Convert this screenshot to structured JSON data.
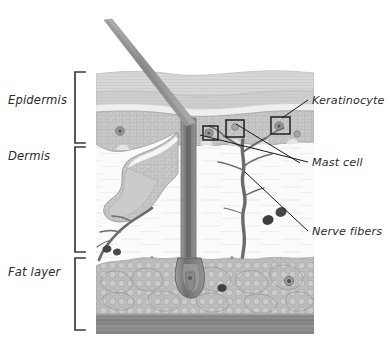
{
  "figure": {
    "type": "anatomical-cross-section",
    "orientation": "vertical-layers"
  },
  "layer_labels": [
    {
      "id": "epidermis",
      "text": "Epidermis",
      "side": "left",
      "text_x": 8,
      "text_y": 104,
      "bracket_x": 74,
      "bracket_top": 72,
      "bracket_bottom": 143
    },
    {
      "id": "dermis",
      "text": "Dermis",
      "side": "left",
      "text_x": 8,
      "text_y": 160,
      "bracket_x": 74,
      "bracket_top": 147,
      "bracket_bottom": 252
    },
    {
      "id": "fat-layer",
      "text": "Fat layer",
      "side": "left",
      "text_x": 8,
      "text_y": 276,
      "bracket_x": 74,
      "bracket_top": 258,
      "bracket_bottom": 330
    }
  ],
  "callouts": [
    {
      "id": "keratinocyte",
      "text": "Keratinocyte",
      "text_x": 312,
      "text_y": 104,
      "leader": [
        [
          308,
          100
        ],
        [
          275,
          124
        ]
      ],
      "marker_boxes": [
        [
          271,
          117,
          19,
          17
        ],
        [
          226,
          120,
          18,
          17
        ],
        [
          203,
          126,
          15,
          14
        ]
      ]
    },
    {
      "id": "mast-cell",
      "text": "Mast cell",
      "text_x": 312,
      "text_y": 166,
      "leader": [
        [
          308,
          162
        ],
        [
          200,
          135
        ]
      ],
      "extra_leaders": [
        [
          [
            296,
            163
          ],
          [
            234,
            123
          ]
        ]
      ]
    },
    {
      "id": "nerve-fibers",
      "text": "Nerve fibers",
      "text_x": 312,
      "text_y": 235,
      "leader": [
        [
          308,
          231
        ],
        [
          243,
          175
        ]
      ]
    }
  ],
  "colors": {
    "background": "#ffffff",
    "text": "#2b2b2b",
    "bracket": "#3a3a3a",
    "leader_line": "#1a1a1a",
    "epidermis_upper": "#d5d5d5",
    "epidermis_granular": "#cfcfcf",
    "epidermis_basal": "#bfbfbf",
    "dermis": "#fafafa",
    "dermis_line": "#dcdcdc",
    "fat_layer": "#b5b5b5",
    "fat_lobule": "#c8c8c8",
    "muscle": "#8f8f8f",
    "hair_shaft": "#9a9a9a",
    "follicle": "#7e7e7e",
    "nerve": "#6e6e6e",
    "mast_cell_dot": "#3d3d3d",
    "sebaceous": "#c2c2c2"
  },
  "structures": [
    {
      "id": "hair-shaft",
      "label": "hair shaft"
    },
    {
      "id": "hair-follicle",
      "label": "hair follicle"
    },
    {
      "id": "hair-bulb",
      "label": "hair bulb"
    },
    {
      "id": "sebaceous-gland",
      "label": "sebaceous gland"
    },
    {
      "id": "nerve-fiber-network",
      "label": "nerve fiber network"
    },
    {
      "id": "mast-cell-dots",
      "label": "mast cells"
    },
    {
      "id": "adipose-lobules",
      "label": "adipose lobules"
    },
    {
      "id": "muscle-band",
      "label": "muscle band"
    }
  ]
}
